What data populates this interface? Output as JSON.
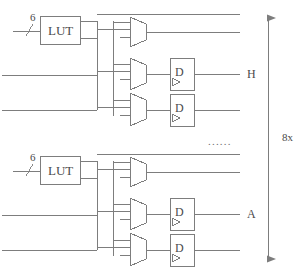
{
  "diagram": {
    "line_color": "#7d7d7d",
    "text_color": "#4a4a4a",
    "blocks": [
      {
        "id": "block-h",
        "lut_label": "LUT",
        "bus_width_label": "6",
        "flipflop_label": "D",
        "output_label": "H",
        "mux_count": 3,
        "flipflop_count": 2
      },
      {
        "id": "block-a",
        "lut_label": "LUT",
        "bus_width_label": "6",
        "flipflop_label": "D",
        "output_label": "A",
        "mux_count": 3,
        "flipflop_count": 2
      }
    ],
    "repeat_marker": "......",
    "multiplicity_label": "8x"
  }
}
